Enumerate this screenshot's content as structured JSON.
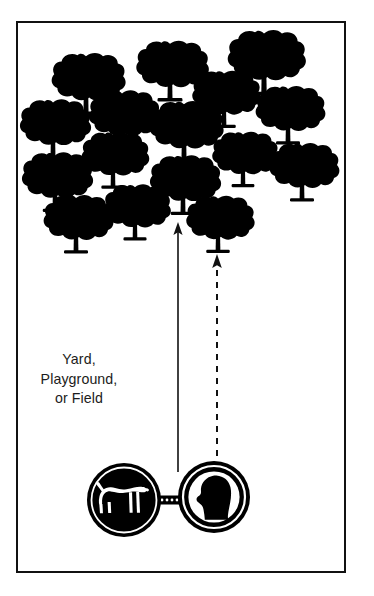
{
  "page": {
    "title": "Yard, Playground, or Field",
    "width": 374,
    "height": 596,
    "background_color": "#ffffff",
    "ink_color": "#000000",
    "frame_color": "#111111",
    "text_color": "#1c1c20"
  },
  "frame": {
    "name": "diagram-border",
    "x": 16,
    "y": 21,
    "width": 330,
    "height": 552,
    "stroke_width": 2
  },
  "label": {
    "lines": [
      "Yard,",
      "Playground,",
      "or Field"
    ],
    "line1": "Yard,",
    "line2": "Playground,",
    "line3": "or Field",
    "align": "center",
    "font_size": 14.2,
    "color": "#1c1c20"
  },
  "scene": {
    "description": "Tree-filled open area with a dog and handler at the bottom, two arrows pointing up into the trees",
    "tree_color": "#000000",
    "trees": [
      {
        "id": 1,
        "cx": 86,
        "cy": 88,
        "scale": 1.06
      },
      {
        "id": 2,
        "cx": 170,
        "cy": 75,
        "scale": 1.04
      },
      {
        "id": 3,
        "cx": 264,
        "cy": 67,
        "scale": 1.12
      },
      {
        "id": 4,
        "cx": 122,
        "cy": 124,
        "scale": 1.02
      },
      {
        "id": 5,
        "cx": 224,
        "cy": 103,
        "scale": 0.98
      },
      {
        "id": 6,
        "cx": 288,
        "cy": 119,
        "scale": 1.0
      },
      {
        "id": 7,
        "cx": 53,
        "cy": 133,
        "scale": 1.02
      },
      {
        "id": 8,
        "cx": 184,
        "cy": 136,
        "scale": 1.06
      },
      {
        "id": 9,
        "cx": 113,
        "cy": 164,
        "scale": 0.97
      },
      {
        "id": 10,
        "cx": 243,
        "cy": 163,
        "scale": 0.95
      },
      {
        "id": 11,
        "cx": 55,
        "cy": 186,
        "scale": 1.02
      },
      {
        "id": 12,
        "cx": 302,
        "cy": 176,
        "scale": 1.0
      },
      {
        "id": 13,
        "cx": 183,
        "cy": 189,
        "scale": 1.02
      },
      {
        "id": 14,
        "cx": 135,
        "cy": 216,
        "scale": 0.96
      },
      {
        "id": 15,
        "cx": 76,
        "cy": 228,
        "scale": 1.0
      },
      {
        "id": 16,
        "cx": 218,
        "cy": 228,
        "scale": 0.98
      }
    ],
    "arrows": [
      {
        "name": "dog-path-arrow",
        "style": "solid",
        "x": 178,
        "y_tail": 472,
        "y_head": 224,
        "stroke_width": 1.6,
        "color": "#111111",
        "meaning": "dog runs ahead into the trees"
      },
      {
        "name": "handler-path-arrow",
        "style": "dashed",
        "x": 217,
        "y_tail": 468,
        "y_head": 256,
        "stroke_width": 2.0,
        "dash": "6 6",
        "color": "#111111",
        "meaning": "handler follows the dog"
      }
    ],
    "badges": [
      {
        "name": "dog-badge",
        "icon": "dog-silhouette-icon",
        "cx": 124,
        "cy": 500,
        "r": 37,
        "fill": "#000000",
        "figure_fill": "#ffffff",
        "facing": "right"
      },
      {
        "name": "handler-badge",
        "icon": "person-head-profile-icon",
        "cx": 214,
        "cy": 497,
        "r": 36,
        "fill": "#ffffff",
        "figure_fill": "#000000",
        "facing": "left"
      }
    ],
    "leash": {
      "name": "leash-connector",
      "x1": 159,
      "x2": 179,
      "y": 500,
      "style": "dotted-bar",
      "color": "#000000"
    }
  }
}
